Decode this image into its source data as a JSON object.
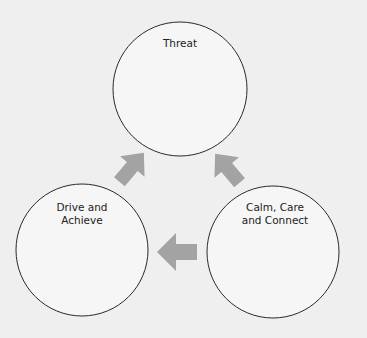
{
  "diagram": {
    "type": "three-circle cycle",
    "colors": {
      "background": "#efefef",
      "circle_fill": "#f6f6f6",
      "circle_stroke": "#2a2a2a",
      "arrow": "#a3a3a3",
      "text": "#222222"
    },
    "nodes": [
      {
        "id": "threat",
        "label": "Threat",
        "cx": 180,
        "cy": 89,
        "r": 67
      },
      {
        "id": "drive",
        "label": "Drive and\nAchieve",
        "cx": 82,
        "cy": 250,
        "r": 66
      },
      {
        "id": "calm",
        "label": "Calm, Care\nand Connect",
        "cx": 273,
        "cy": 252,
        "r": 66
      }
    ],
    "arrows": [
      {
        "from": "drive",
        "to": "threat",
        "direction": "up-right"
      },
      {
        "from": "calm",
        "to": "threat",
        "direction": "up-left"
      },
      {
        "from": "calm",
        "to": "drive",
        "direction": "left"
      }
    ]
  }
}
